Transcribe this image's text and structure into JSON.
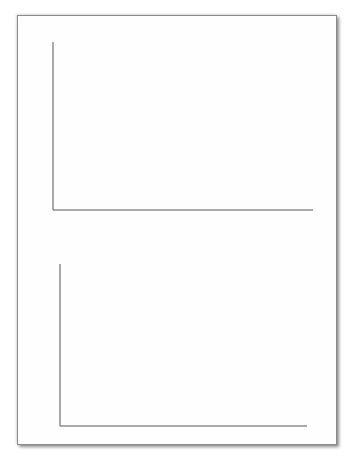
{
  "chart_data": [
    {
      "type": "line",
      "title": "",
      "ylabel": "p_j",
      "ylabel_main": "p",
      "ylabel_sub": "j",
      "xlabel": "t_j",
      "xlabel_main": "t",
      "xlabel_sub": "j",
      "xlim": [
        0,
        1.6
      ],
      "ylim": [
        -1.05,
        0.9
      ],
      "xticks": [
        0.5,
        1.0,
        1.5
      ],
      "xtick_labels": [
        "0.5",
        "1.0",
        "1.5"
      ],
      "yticks": [
        0.5,
        0.0,
        -0.5,
        -1.0
      ],
      "ytick_labels": [
        "0.5",
        "0.0",
        "−0.5",
        "−1.0"
      ],
      "grid": false,
      "line_color": "#777777",
      "description": "Oscillating signal, ~60 cycles over 1.6 s, amplitude envelope ~0.8 near t=0.1, shrinking to ~0.4 at t=0.45, growing to ~0.8 near t=0.65, irregular ~0.4 around t=0.8-1.2, growing to ~0.85 near t=1.35-1.55; starts with spike down to about -1.0 at t=0",
      "envelope": {
        "t": [
          0.0,
          0.05,
          0.12,
          0.25,
          0.45,
          0.6,
          0.64,
          0.7,
          0.8,
          1.0,
          1.15,
          1.3,
          1.4,
          1.5,
          1.6
        ],
        "upper": [
          0.5,
          0.8,
          0.78,
          0.6,
          0.45,
          0.55,
          0.78,
          0.8,
          0.5,
          0.45,
          0.5,
          0.8,
          0.85,
          0.75,
          0.55
        ],
        "lower": [
          -1.0,
          -0.7,
          -0.65,
          -0.55,
          -0.45,
          -0.5,
          -0.75,
          -0.8,
          -0.5,
          -0.45,
          -0.5,
          -0.78,
          -0.85,
          -0.8,
          -0.6
        ]
      }
    },
    {
      "type": "bar",
      "title": "",
      "ylabel": "|P_k|^2",
      "ylabel_main": "|P",
      "ylabel_sub": "k",
      "ylabel_tail": "|",
      "ylabel_sup": "2",
      "xlabel": "f_k",
      "xlabel_main": "f",
      "xlabel_sub": "k",
      "xlim": [
        0,
        2000
      ],
      "ylim": [
        0,
        10000000
      ],
      "xticks": [
        0,
        500,
        1000,
        1500,
        2000
      ],
      "xtick_labels": [
        "0",
        "500",
        "1000",
        "1500",
        "2000"
      ],
      "yticks": [
        0,
        2000000,
        4000000,
        6000000,
        8000000,
        10000000
      ],
      "ytick_labels": [
        {
          "base": "0",
          "exp": ""
        },
        {
          "base": "2×10",
          "exp": "6"
        },
        {
          "base": "4×10",
          "exp": "6"
        },
        {
          "base": "6×10",
          "exp": "6"
        },
        {
          "base": "8×10",
          "exp": "6"
        },
        {
          "base": "1×10",
          "exp": "7"
        }
      ],
      "grid": false,
      "bar_color": "#8a8a8a",
      "peaks": {
        "f": [
          30,
          38,
          45,
          52,
          58,
          65,
          72,
          85,
          100,
          120,
          150,
          175,
          200,
          240,
          250,
          260,
          290,
          320,
          350,
          390,
          450,
          520,
          600
        ],
        "power": [
          5400000,
          10000000,
          2000000,
          7500000,
          1000000,
          9500000,
          700000,
          500000,
          300000,
          1300000,
          1100000,
          300000,
          550000,
          200000,
          3600000,
          150000,
          1200000,
          700000,
          150000,
          300000,
          80000,
          50000,
          30000
        ]
      }
    }
  ]
}
